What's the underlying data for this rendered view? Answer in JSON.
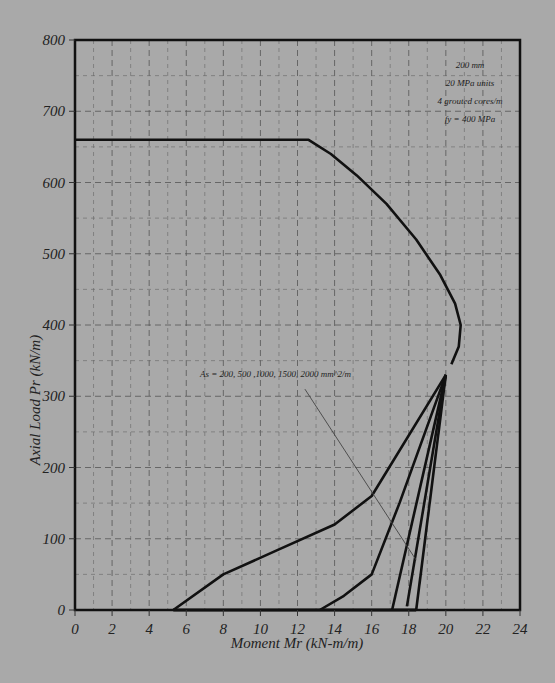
{
  "chart_data": {
    "type": "line",
    "title": "",
    "xlabel": "Moment Mr (kN-m/m)",
    "ylabel": "Axial Load Pr (kN/m)",
    "xlim": [
      0,
      24
    ],
    "ylim": [
      0,
      800
    ],
    "x_ticks": [
      "0",
      "2",
      "4",
      "6",
      "8",
      "10",
      "12",
      "14",
      "16",
      "18",
      "20",
      "22",
      "24"
    ],
    "y_ticks": [
      "0",
      "100",
      "200",
      "300",
      "400",
      "500",
      "600",
      "700",
      "800"
    ],
    "grid": true,
    "legend": null,
    "annotations": {
      "info_box": [
        "200 mm",
        "20 MPa units",
        "4 grouted cores/m",
        "fy = 400 MPa"
      ],
      "series_label": "As = 200, 500 ,1000, 1500, 2000 mm^2/m"
    },
    "envelope": {
      "name": "Compression envelope (common)",
      "x": [
        0,
        12.6,
        13.8,
        15.2,
        16.8,
        18.4,
        19.7,
        20.5,
        20.8,
        20.7,
        20.3
      ],
      "y": [
        660,
        660,
        640,
        610,
        570,
        520,
        470,
        430,
        400,
        370,
        345
      ]
    },
    "series": [
      {
        "name": "As = 200 mm^2/m",
        "x": [
          20.0,
          16.0,
          14.0,
          11.0,
          8.0,
          5.3
        ],
        "y": [
          330,
          160,
          120,
          85,
          50,
          0
        ]
      },
      {
        "name": "As = 500 mm^2/m",
        "x": [
          20.0,
          17.5,
          16.0,
          14.5,
          13.2
        ],
        "y": [
          330,
          150,
          50,
          20,
          0
        ]
      },
      {
        "name": "As = 1000 mm^2/m",
        "x": [
          20.0,
          17.1
        ],
        "y": [
          330,
          0
        ]
      },
      {
        "name": "As = 1500 mm^2/m",
        "x": [
          20.0,
          17.9
        ],
        "y": [
          330,
          5
        ]
      },
      {
        "name": "As = 2000 mm^2/m",
        "x": [
          20.0,
          18.4
        ],
        "y": [
          330,
          0
        ]
      }
    ],
    "pointer_line": {
      "x": [
        12.4,
        18.4
      ],
      "y": [
        310,
        70
      ]
    }
  }
}
